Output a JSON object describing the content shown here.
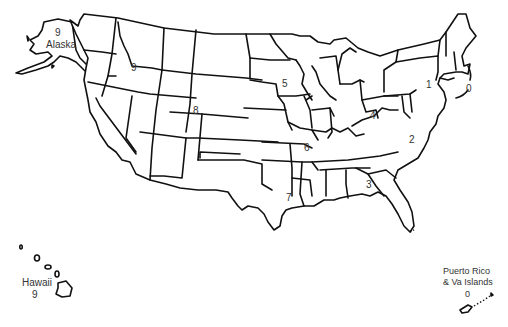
{
  "map": {
    "title": "",
    "colors": {
      "outline": "#111111",
      "label": "#333333",
      "fill": "#ffffff"
    },
    "regions": [
      {
        "id": "region-1",
        "value": "1"
      },
      {
        "id": "region-2",
        "value": "2"
      },
      {
        "id": "region-3",
        "value": "3"
      },
      {
        "id": "region-4",
        "value": "4"
      },
      {
        "id": "region-5",
        "value": "5"
      },
      {
        "id": "region-6",
        "value": "6"
      },
      {
        "id": "region-7",
        "value": "7"
      },
      {
        "id": "region-8",
        "value": "8"
      },
      {
        "id": "region-9",
        "value": "9"
      },
      {
        "id": "region-new-england",
        "value": "0"
      }
    ],
    "alaska": {
      "name": "Alaska",
      "value": "9"
    },
    "hawaii": {
      "name": "Hawaii",
      "value": "9"
    },
    "puerto_rico": {
      "name_line1": "Puerto Rico",
      "name_line2": "& Va Islands",
      "value": "0"
    }
  }
}
